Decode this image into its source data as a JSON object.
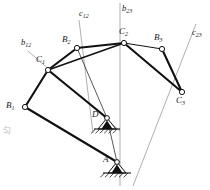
{
  "diagram": {
    "type": "kinematic-linkage-three-position-synthesis",
    "background_color": "#ffffff",
    "link_color": "#111111",
    "construction_color": "#8c8c8c",
    "joint_fill": "#ffffff",
    "joints": [
      {
        "id": "B1",
        "label": "B",
        "sub": "1",
        "x": 25,
        "y": 107,
        "r": 2.6,
        "label_x": 6,
        "label_y": 101,
        "fixed": false
      },
      {
        "id": "C1",
        "label": "C",
        "sub": "1",
        "x": 48,
        "y": 70,
        "r": 2.6,
        "label_x": 36,
        "label_y": 55,
        "fixed": false
      },
      {
        "id": "B2",
        "label": "B",
        "sub": "2",
        "x": 77,
        "y": 48,
        "r": 2.6,
        "label_x": 62,
        "label_y": 35,
        "fixed": false
      },
      {
        "id": "C2",
        "label": "C",
        "sub": "2",
        "x": 124,
        "y": 43,
        "r": 2.6,
        "label_x": 119,
        "label_y": 27,
        "fixed": false
      },
      {
        "id": "B3",
        "label": "B",
        "sub": "3",
        "x": 162,
        "y": 49,
        "r": 2.6,
        "label_x": 154,
        "label_y": 33,
        "fixed": false
      },
      {
        "id": "C3",
        "label": "C",
        "sub": "3",
        "x": 182,
        "y": 92,
        "r": 2.6,
        "label_x": 176,
        "label_y": 96,
        "fixed": false
      },
      {
        "id": "D",
        "label": "D",
        "sub": "",
        "x": 107,
        "y": 118,
        "r": 2.4,
        "label_x": 92,
        "label_y": 110,
        "fixed": true
      },
      {
        "id": "A",
        "label": "A",
        "sub": "",
        "x": 117,
        "y": 162,
        "r": 2.4,
        "label_x": 103,
        "label_y": 155,
        "fixed": true
      }
    ],
    "links": [
      {
        "name": "link-B1-C1",
        "from": "B1",
        "to": "C1",
        "width": 2.1
      },
      {
        "name": "link-C1-B2",
        "from": "C1",
        "to": "B2",
        "width": 2.1
      },
      {
        "name": "link-B2-C2",
        "from": "B2",
        "to": "C2",
        "width": 2.1
      },
      {
        "name": "link-C1-C2",
        "from": "C1",
        "to": "C2",
        "width": 1.5
      },
      {
        "name": "link-B2-D",
        "from": "B2",
        "to": "D",
        "width": 0.7
      },
      {
        "name": "link-C2-B3",
        "from": "C2",
        "to": "B3",
        "width": 1.0
      },
      {
        "name": "link-B3-C3",
        "from": "B3",
        "to": "C3",
        "width": 2.1
      },
      {
        "name": "link-C2-C3",
        "from": "C2",
        "to": "C3",
        "width": 2.1
      },
      {
        "name": "link-C1-D",
        "from": "C1",
        "to": "D",
        "width": 2.1
      },
      {
        "name": "link-B1-A",
        "from": "B1",
        "to": "A",
        "width": 2.1
      },
      {
        "name": "link-B1-C1b",
        "from": "B1",
        "to": "C1",
        "width": 1.0
      },
      {
        "name": "link-D-A",
        "from": "D",
        "to": "A",
        "width": 0.7
      }
    ],
    "construction_lines": [
      {
        "name": "construction-line-b12",
        "label": "b",
        "sub": "12",
        "x1": 28,
        "y1": 51,
        "x2": 120,
        "y2": 131,
        "label_x": 21,
        "label_y": 38
      },
      {
        "name": "construction-line-c12",
        "label": "c",
        "sub": "12",
        "x1": 79,
        "y1": 20,
        "x2": 93,
        "y2": 133,
        "label_x": 79,
        "label_y": 9
      },
      {
        "name": "construction-line-b23",
        "label": "b",
        "sub": "23",
        "x1": 120,
        "y1": 3,
        "x2": 120,
        "y2": 186,
        "label_x": 122,
        "label_y": 4
      },
      {
        "name": "construction-line-c23",
        "label": "c",
        "sub": "23",
        "x1": 196,
        "y1": 24,
        "x2": 133,
        "y2": 186,
        "label_x": 192,
        "label_y": 28
      }
    ],
    "supports": [
      {
        "name": "ground-support-D",
        "joint": "D",
        "tri_half_width": 9,
        "tri_height": 11,
        "base_half_width": 13,
        "hatch_count": 6,
        "hatch_len": 6
      },
      {
        "name": "ground-support-A",
        "joint": "A",
        "tri_half_width": 9,
        "tri_height": 11,
        "base_half_width": 14,
        "hatch_count": 6,
        "hatch_len": 6
      }
    ],
    "artifact_text": "匀"
  }
}
